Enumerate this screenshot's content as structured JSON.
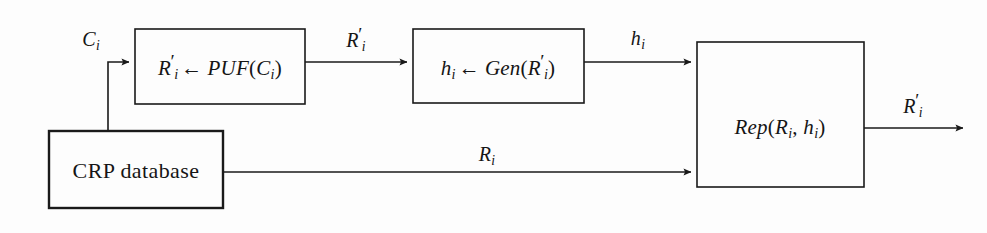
{
  "diagram": {
    "background_color": "#fdfdfd",
    "line_color": "#1a1a1a",
    "nodes": [
      {
        "id": "puf-box",
        "type": "process-box",
        "label_plain": "R'i <- PUF(Ci)",
        "parts": {
          "out_var": "R",
          "out_prime": "′",
          "out_sub": "i",
          "arrow": "←",
          "fn": "PUF",
          "arg_var": "C",
          "arg_sub": "i"
        }
      },
      {
        "id": "gen-box",
        "type": "process-box",
        "label_plain": "hi <- Gen(R'i)",
        "parts": {
          "out_var": "h",
          "out_sub": "i",
          "arrow": "←",
          "fn": "Gen",
          "arg_var": "R",
          "arg_prime": "′",
          "arg_sub": "i"
        }
      },
      {
        "id": "rep-box",
        "type": "process-box",
        "label_plain": "Rep(Ri, hi)",
        "parts": {
          "fn": "Rep",
          "arg1_var": "R",
          "arg1_sub": "i",
          "sep": ",",
          "arg2_var": "h",
          "arg2_sub": "i"
        }
      },
      {
        "id": "crp-database",
        "type": "data-store-box",
        "label": "CRP database"
      }
    ],
    "edges": [
      {
        "id": "crp-to-puf",
        "from": "crp-database",
        "to": "puf-box",
        "label_plain": "Ci",
        "var": "C",
        "sub": "i"
      },
      {
        "id": "puf-to-gen",
        "from": "puf-box",
        "to": "gen-box",
        "label_plain": "R'i",
        "var": "R",
        "prime": "′",
        "sub": "i"
      },
      {
        "id": "gen-to-rep",
        "from": "gen-box",
        "to": "rep-box",
        "label_plain": "hi",
        "var": "h",
        "sub": "i"
      },
      {
        "id": "crp-to-rep",
        "from": "crp-database",
        "to": "rep-box",
        "label_plain": "Ri",
        "var": "R",
        "sub": "i"
      },
      {
        "id": "rep-output",
        "from": "rep-box",
        "to": "output",
        "label_plain": "R'i",
        "var": "R",
        "prime": "′",
        "sub": "i"
      }
    ]
  }
}
